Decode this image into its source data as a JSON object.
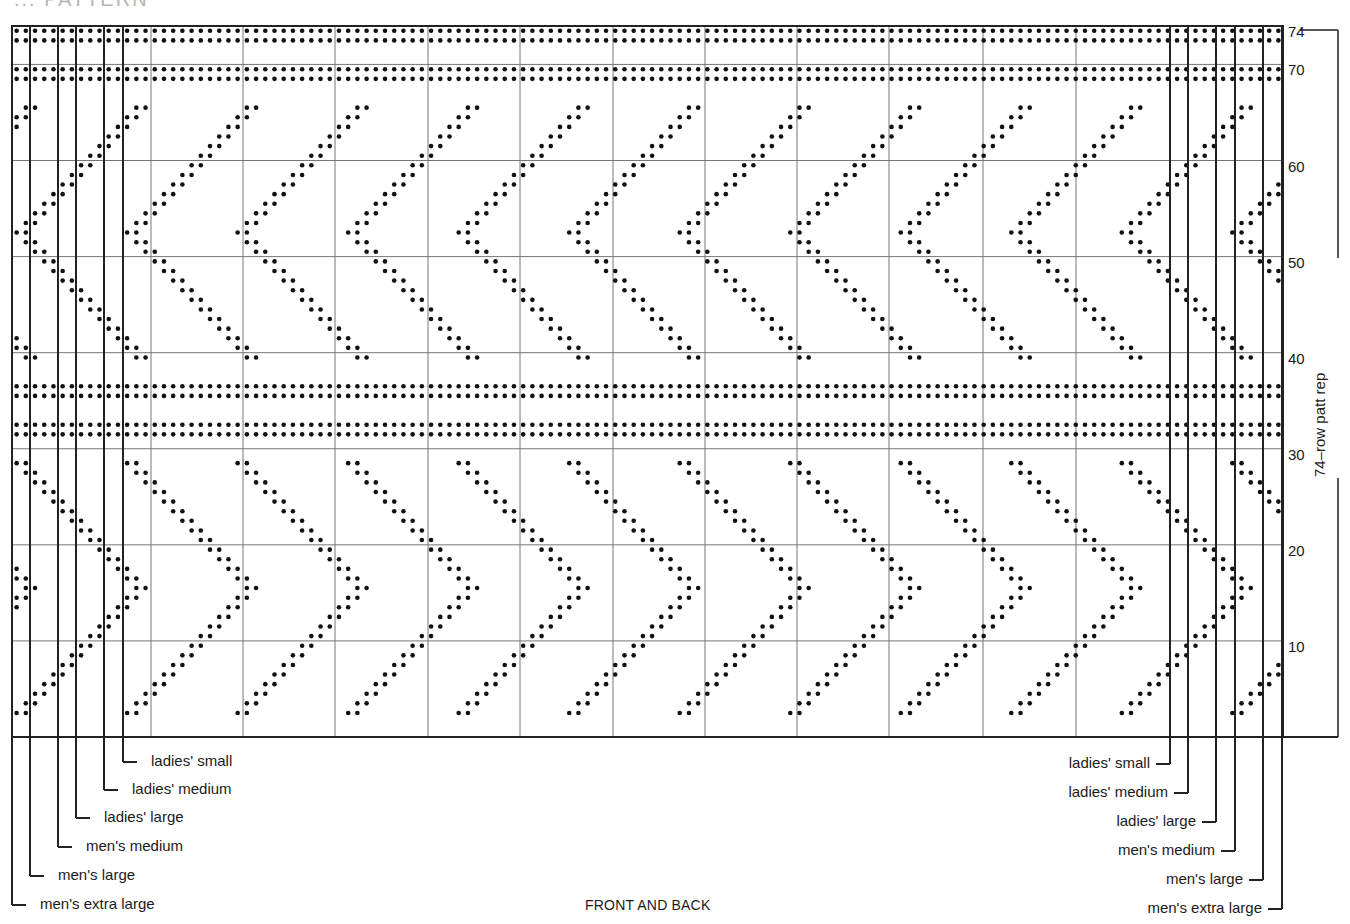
{
  "title_fragment": "... PATTERN",
  "caption": "FRONT AND BACK",
  "repeat_label": "74–row patt rep",
  "row_numbers": [
    {
      "label": "74",
      "row": 74
    },
    {
      "label": "70",
      "row": 70
    },
    {
      "label": "60",
      "row": 60
    },
    {
      "label": "50",
      "row": 50
    },
    {
      "label": "40",
      "row": 40
    },
    {
      "label": "30",
      "row": 30
    },
    {
      "label": "20",
      "row": 20
    },
    {
      "label": "10",
      "row": 10
    }
  ],
  "size_labels_left": [
    {
      "label": "ladies' small",
      "line_x": 123,
      "y": 762,
      "text_x": 151
    },
    {
      "label": "ladies' medium",
      "line_x": 104,
      "y": 790,
      "text_x": 132
    },
    {
      "label": "ladies' large",
      "line_x": 76,
      "y": 818,
      "text_x": 104
    },
    {
      "label": "men's medium",
      "line_x": 58,
      "y": 847,
      "text_x": 86
    },
    {
      "label": "men's large",
      "line_x": 30,
      "y": 876,
      "text_x": 58
    },
    {
      "label": "men's extra large",
      "line_x": 12,
      "y": 905,
      "text_x": 40
    }
  ],
  "size_labels_right": [
    {
      "label": "ladies' small",
      "line_x": 1170,
      "y": 764,
      "text_right": 1150
    },
    {
      "label": "ladies' medium",
      "line_x": 1188,
      "y": 793,
      "text_right": 1168
    },
    {
      "label": "ladies' large",
      "line_x": 1216,
      "y": 822,
      "text_right": 1196
    },
    {
      "label": "men's medium",
      "line_x": 1235,
      "y": 851,
      "text_right": 1215
    },
    {
      "label": "men's large",
      "line_x": 1263,
      "y": 880,
      "text_right": 1243
    },
    {
      "label": "men's extra large",
      "line_x": 1282,
      "y": 909,
      "text_right": 1262
    }
  ],
  "chart_data": {
    "type": "knitting-chart",
    "rows": 74,
    "stitches": 138,
    "grid": {
      "left": 12,
      "top": 26,
      "right": 1283,
      "bottom": 737
    },
    "thin_grid_every_rows": 10,
    "thin_grid_cols_x": [
      151,
      243,
      335,
      428,
      520,
      613,
      705,
      797,
      889,
      983,
      1076
    ],
    "size_lines_x": [
      12,
      30,
      58,
      76,
      104,
      123,
      1170,
      1188,
      1216,
      1235,
      1263,
      1282
    ],
    "solid_band_rows": [
      73,
      74,
      69,
      70,
      36,
      37,
      32,
      33
    ],
    "chevron_repeat_stitches": 12,
    "upper_chevron": {
      "direction": "left",
      "rows": [
        40,
        66
      ],
      "apex_row": 53
    },
    "lower_chevron": {
      "direction": "right",
      "rows": [
        3,
        29
      ],
      "apex_row": 16
    },
    "dot_color": "#111111",
    "line_color": "#222222",
    "thin_line_color": "#777777"
  }
}
